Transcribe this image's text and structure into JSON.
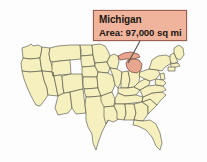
{
  "image": {
    "kind": "us-states-map-with-callout",
    "width": 207,
    "height": 162,
    "background_color": "#ffffff"
  },
  "callout": {
    "title": "Michigan",
    "detail": "Area: 97,000 sq mi",
    "fill_color": "#f0b49c",
    "border_color": "#9c5e4c",
    "text_color": "#1b1714"
  },
  "map": {
    "state_fill_color": "#f5f0bd",
    "state_border_color": "#4a4a42",
    "highlight_fill_color": "#e8a68f",
    "highlight_border_color": "#6b4038",
    "leader_line_color": "#55504a",
    "highlighted_state": "Michigan"
  }
}
